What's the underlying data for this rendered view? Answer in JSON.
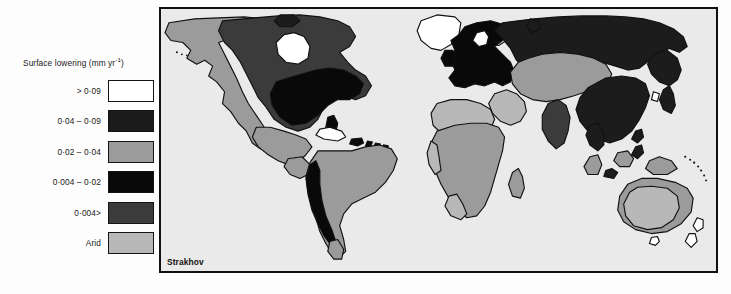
{
  "figure": {
    "type": "thematic-world-map",
    "background_color": "#fdfdfd"
  },
  "legend": {
    "title_text": "Surface lowering (mm yr",
    "title_superscript": "-1",
    "title_suffix": ")",
    "title_full": "Surface lowering (mm yr-1)",
    "items": [
      {
        "label": "> 0·09",
        "color": "#ffffff",
        "name": "gt-0-09"
      },
      {
        "label": "0·04 – 0·09",
        "color": "#1c1c1c",
        "name": "0-04-to-0-09"
      },
      {
        "label": "0·02 – 0·04",
        "color": "#9b9b9b",
        "name": "0-02-to-0-04"
      },
      {
        "label": "0·004 – 0·02",
        "color": "#090909",
        "name": "0-004-to-0-02"
      },
      {
        "label": "0·004>",
        "color": "#3b3b3b",
        "name": "lt-0-004"
      },
      {
        "label": "Arid",
        "color": "#b8b8b8",
        "name": "arid"
      }
    ]
  },
  "map": {
    "credit": "Strakhov",
    "ocean_color": "#eaeaea",
    "frame_color": "#111111",
    "outline_color": "#111111"
  },
  "colors": {
    "white": "#ffffff",
    "near_black": "#1c1c1c",
    "black": "#090909",
    "dark_gray": "#3b3b3b",
    "mid_gray": "#9b9b9b",
    "light_gray": "#b8b8b8",
    "ocean": "#eaeaea",
    "ink": "#111111"
  }
}
